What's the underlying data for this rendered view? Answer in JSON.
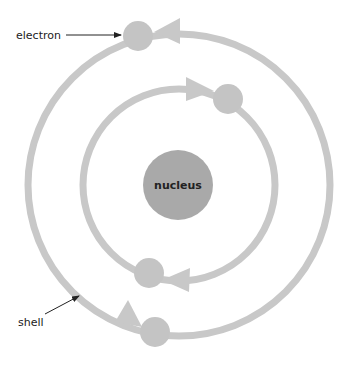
{
  "diagram": {
    "labels": {
      "nucleus": "nucleus",
      "electron": "electron",
      "shell": "shell"
    },
    "colors": {
      "shell": "#c8c8c8",
      "electron": "#c4c4c4",
      "nucleus": "#a9a9a9",
      "text": "#222222",
      "pointer": "#222222"
    },
    "nucleus": {
      "cx": 178,
      "cy": 185,
      "r": 35
    },
    "shells": [
      {
        "name": "inner",
        "cx": 179,
        "cy": 185,
        "r": 96
      },
      {
        "name": "outer",
        "cx": 179,
        "cy": 185,
        "r": 151
      }
    ],
    "electrons": [
      {
        "shell": "outer",
        "x": 138,
        "y": 36
      },
      {
        "shell": "inner",
        "x": 228,
        "y": 99
      },
      {
        "shell": "inner",
        "x": 149,
        "y": 273
      },
      {
        "shell": "outer",
        "x": 155,
        "y": 332
      }
    ]
  }
}
